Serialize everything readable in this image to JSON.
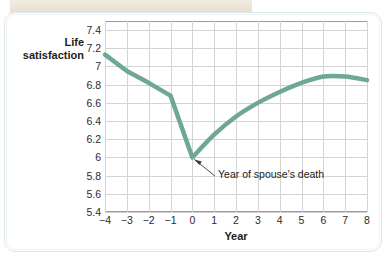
{
  "figure": {
    "background_color": "#ffffff",
    "card_border_color": "#dfe8ea",
    "page_strip_color": "#ece5d6"
  },
  "chart_data": {
    "type": "line",
    "title": "",
    "xlabel": "Year",
    "ylabel": "Life satisfaction",
    "xlim": [
      -4,
      8
    ],
    "ylim": [
      5.4,
      7.5
    ],
    "grid": true,
    "legend": "none",
    "line_color": "#6fa795",
    "line_width": 4.5,
    "x": [
      -4,
      -3,
      -2,
      -1,
      0,
      1,
      2,
      3,
      4,
      5,
      6,
      7,
      8
    ],
    "values": [
      7.13,
      6.95,
      6.82,
      6.68,
      6.0,
      6.25,
      6.45,
      6.6,
      6.72,
      6.82,
      6.89,
      6.89,
      6.85
    ],
    "xticks": [
      "−4",
      "−3",
      "−2",
      "−1",
      "0",
      "1",
      "2",
      "3",
      "4",
      "5",
      "6",
      "7",
      "8"
    ],
    "xtick_values": [
      -4,
      -3,
      -2,
      -1,
      0,
      1,
      2,
      3,
      4,
      5,
      6,
      7,
      8
    ],
    "yticks": [
      "7.4",
      "7.2",
      "7",
      "6.8",
      "6.6",
      "6.4",
      "6.2",
      "6",
      "5.8",
      "5.6",
      "5.4"
    ],
    "ytick_values": [
      7.4,
      7.2,
      7.0,
      6.8,
      6.6,
      6.4,
      6.2,
      6.0,
      5.8,
      5.6,
      5.4
    ],
    "annotations": [
      {
        "text": "Year of spouse's death",
        "point_x": 0,
        "point_y": 6.0
      }
    ]
  }
}
